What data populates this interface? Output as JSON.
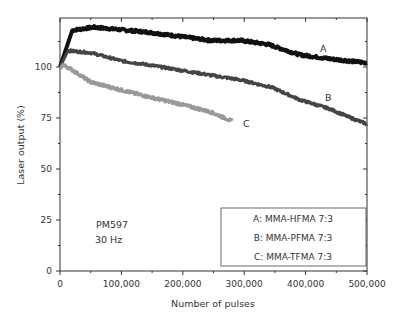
{
  "chart_data": {
    "type": "line",
    "title": "",
    "xlabel": "Number of pulses",
    "ylabel": "Laser output (%)",
    "xlim": [
      0,
      500000
    ],
    "ylim": [
      0,
      124
    ],
    "grid": false,
    "legend_position": "lower right (inside plot)",
    "x_ticks": [
      0,
      100000,
      200000,
      300000,
      400000,
      500000
    ],
    "x_tick_labels": [
      "0",
      "100,000",
      "200,000",
      "300,000",
      "400,000",
      "500,000"
    ],
    "y_ticks": [
      0,
      25,
      50,
      75,
      100
    ],
    "y_tick_labels": [
      "0",
      "25",
      "50",
      "75",
      "100"
    ],
    "annotations": [
      "PM597",
      "30 Hz",
      "A",
      "B",
      "C"
    ],
    "series": [
      {
        "name": "A: MMA-HFMA 7:3",
        "label": "A",
        "color": "#111111",
        "x": [
          0,
          20000,
          55000,
          145000,
          245000,
          295000,
          340000,
          390000,
          440000,
          500000
        ],
        "y": [
          100,
          118,
          119.5,
          117,
          113,
          113,
          111,
          106,
          104,
          102
        ]
      },
      {
        "name": "B: MMA-PFMA 7:3",
        "label": "B",
        "color": "#444444",
        "x": [
          0,
          13000,
          50000,
          100000,
          145000,
          195000,
          245000,
          295000,
          345000,
          390000,
          440000,
          470000,
          500000
        ],
        "y": [
          100,
          108,
          107,
          103,
          101,
          98.5,
          96,
          93.6,
          90,
          84,
          79.4,
          75.5,
          72
        ]
      },
      {
        "name": "C: MMA-TFMA 7:3",
        "label": "C",
        "color": "#999999",
        "x": [
          0,
          5000,
          15000,
          50000,
          100000,
          145000,
          195000,
          245000,
          280000
        ],
        "y": [
          99,
          101,
          99.5,
          92.6,
          88.7,
          85.3,
          81.9,
          78,
          73.5
        ]
      }
    ]
  },
  "plot": {
    "annotation_sample": "PM597",
    "annotation_rate": "30 Hz",
    "curve_labels": {
      "a": "A",
      "b": "B",
      "c": "C"
    },
    "legend": {
      "a": "A: MMA-HFMA 7:3",
      "b": "B: MMA-PFMA 7:3",
      "c": "C: MMA-TFMA 7:3"
    },
    "xaxis_title": "Number of pulses",
    "yaxis_title": "Laser output (%)",
    "xticks": [
      "0",
      "100,000",
      "200,000",
      "300,000",
      "400,000",
      "500,000"
    ],
    "yticks": [
      "0",
      "25",
      "50",
      "75",
      "100"
    ]
  }
}
